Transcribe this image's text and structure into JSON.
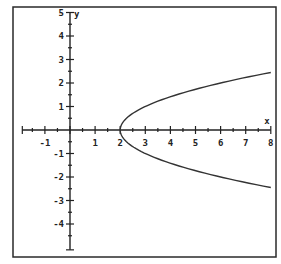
{
  "chart_data": {
    "type": "line",
    "title": "",
    "xlabel": "x",
    "ylabel": "y",
    "xlim": [
      -2.0,
      8
    ],
    "ylim": [
      -5,
      5
    ],
    "grid": false,
    "legend": null,
    "equation": "x = y^2 + 2",
    "x_ticks": [
      -1,
      1,
      2,
      3,
      4,
      5,
      6,
      7,
      8
    ],
    "x_tick_labels": [
      "-1",
      "1",
      "2",
      "3",
      "4",
      "5",
      "6",
      "7",
      "8"
    ],
    "y_ticks": [
      5,
      4,
      3,
      2,
      1,
      -1,
      -2,
      -3,
      -4
    ],
    "y_tick_labels": [
      "5",
      "4",
      "3",
      "2",
      "1",
      "-1",
      "-2",
      "-3",
      "-4"
    ],
    "minor_tick_step": 0.5,
    "series": [
      {
        "name": "parabola",
        "points": [
          [
            8,
            -2.449
          ],
          [
            7,
            -2.236
          ],
          [
            6,
            -2.0
          ],
          [
            5,
            -1.732
          ],
          [
            4,
            -1.414
          ],
          [
            3,
            -1.0
          ],
          [
            2.25,
            -0.5
          ],
          [
            2,
            0
          ],
          [
            2.25,
            0.5
          ],
          [
            3,
            1.0
          ],
          [
            4,
            1.414
          ],
          [
            5,
            1.732
          ],
          [
            6,
            2.0
          ],
          [
            7,
            2.236
          ],
          [
            8,
            2.449
          ]
        ]
      }
    ]
  },
  "axes": {
    "x_label": "x",
    "y_label": "y"
  }
}
